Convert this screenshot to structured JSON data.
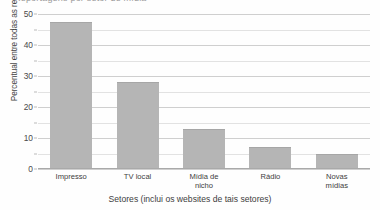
{
  "figure": {
    "cutoff_title": "Reportagens por setor de mídia"
  },
  "chart_data": {
    "type": "bar",
    "title": "",
    "categories": [
      "Impresso",
      "TV local",
      "Mídia de nicho",
      "Rádio",
      "Novas mídias"
    ],
    "category_lines": [
      [
        "Impresso"
      ],
      [
        "TV local"
      ],
      [
        "Mídia de",
        "nicho"
      ],
      [
        "Rádio"
      ],
      [
        "Novas",
        "mídias"
      ]
    ],
    "values": [
      47.5,
      28,
      13,
      7,
      5
    ],
    "xlabel": "Setores (inclui os websites de tais setores)",
    "ylabel": "Percentual entre todas as reportagens",
    "ylim": [
      0,
      50
    ],
    "yticks": [
      0,
      10,
      20,
      30,
      40,
      50
    ],
    "ytick_labels": [
      "0",
      "10",
      "20",
      "30",
      "40",
      "50"
    ],
    "yminor_ticks": [
      5,
      15,
      25,
      35,
      45
    ],
    "grid": true,
    "legend": null,
    "bar_color": "#b5b5b5",
    "gridline_color": "#cfcfcf"
  }
}
